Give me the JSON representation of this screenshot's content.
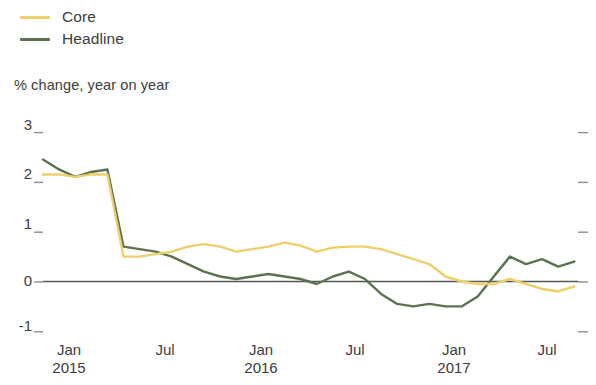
{
  "legend": {
    "position": "top-left",
    "entries": [
      {
        "label": "Core",
        "color": "#eed06a",
        "name": "core"
      },
      {
        "label": "Headline",
        "color": "#5b7350",
        "name": "headline"
      }
    ]
  },
  "axis_caption": "% change, year on year",
  "colors": {
    "core": "#eed06a",
    "headline": "#5b7350",
    "zero_line": "#55584f",
    "tick": "#8d8d8d",
    "text": "#3d3d3d"
  },
  "chart_data": {
    "type": "line",
    "title": "",
    "subtitle": "",
    "xlabel": "",
    "ylabel": "% change, year on year",
    "ylim": [
      -1,
      3
    ],
    "yticks": [
      3,
      2,
      1,
      0,
      -1
    ],
    "grid": false,
    "zero_line": 0,
    "legend_position": "top-left",
    "xlim": [
      "2014-11",
      "2017-09"
    ],
    "xticks": [
      {
        "label": "Jan\n2015",
        "x": "2015-01"
      },
      {
        "label": "Jul",
        "x": "2015-07"
      },
      {
        "label": "Jan\n2016",
        "x": "2016-01"
      },
      {
        "label": "Jul",
        "x": "2016-07"
      },
      {
        "label": "Jan\n2017",
        "x": "2017-01"
      },
      {
        "label": "Jul",
        "x": "2017-07"
      }
    ],
    "x": [
      "2014-11",
      "2014-12",
      "2015-01",
      "2015-02",
      "2015-03",
      "2015-04",
      "2015-05",
      "2015-06",
      "2015-07",
      "2015-08",
      "2015-09",
      "2015-10",
      "2015-11",
      "2015-12",
      "2016-01",
      "2016-02",
      "2016-03",
      "2016-04",
      "2016-05",
      "2016-06",
      "2016-07",
      "2016-08",
      "2016-09",
      "2016-10",
      "2016-11",
      "2016-12",
      "2017-01",
      "2017-02",
      "2017-03",
      "2017-04",
      "2017-05",
      "2017-06",
      "2017-07",
      "2017-08"
    ],
    "series": [
      {
        "name": "Headline",
        "color": "#5b7350",
        "values": [
          2.45,
          2.25,
          2.1,
          2.2,
          2.25,
          0.7,
          0.65,
          0.6,
          0.5,
          0.35,
          0.2,
          0.1,
          0.05,
          0.1,
          0.15,
          0.1,
          0.05,
          -0.05,
          0.1,
          0.2,
          0.05,
          -0.25,
          -0.45,
          -0.5,
          -0.45,
          -0.5,
          -0.5,
          -0.3,
          0.1,
          0.5,
          0.35,
          0.45,
          0.3,
          0.4
        ]
      },
      {
        "name": "Core",
        "color": "#eed06a",
        "values": [
          2.15,
          2.15,
          2.1,
          2.15,
          2.15,
          0.5,
          0.5,
          0.55,
          0.6,
          0.7,
          0.75,
          0.7,
          0.6,
          0.65,
          0.7,
          0.78,
          0.72,
          0.6,
          0.68,
          0.7,
          0.7,
          0.65,
          0.55,
          0.45,
          0.35,
          0.1,
          0.0,
          -0.05,
          -0.05,
          0.05,
          -0.05,
          -0.15,
          -0.2,
          -0.1
        ]
      }
    ]
  }
}
